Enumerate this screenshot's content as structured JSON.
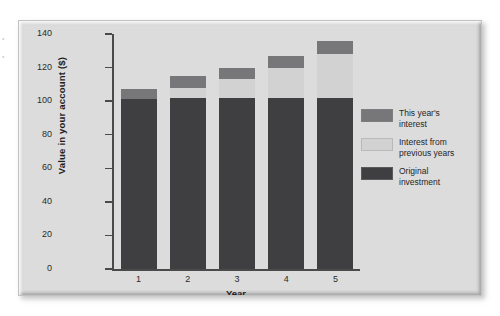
{
  "margin_bleed": [
    "•",
    "•"
  ],
  "chart_data": {
    "type": "bar",
    "subtype": "stacked-vertical",
    "title": "",
    "xlabel": "Year",
    "ylabel": "Value in your account ($)",
    "categories": [
      "1",
      "2",
      "3",
      "4",
      "5"
    ],
    "ylim": [
      0,
      140
    ],
    "yticks": [
      0,
      20,
      40,
      60,
      80,
      100,
      120,
      140
    ],
    "grid": false,
    "legend_position": "right",
    "series": [
      {
        "name": "Original investment",
        "color": "#3f3f42",
        "values": [
          101,
          102,
          102,
          102,
          102
        ]
      },
      {
        "name": "Interest from previous years",
        "color": "#d2d2d2",
        "values": [
          0,
          6,
          11,
          18,
          26
        ]
      },
      {
        "name": "This year's interest",
        "color": "#77777a",
        "values": [
          6,
          7,
          7,
          7,
          8
        ]
      }
    ],
    "totals": [
      107,
      115,
      120,
      127,
      136
    ],
    "annotations": []
  },
  "legend": {
    "items": [
      {
        "label_line1": "This year's",
        "label_line2": "interest",
        "color": "#77777a"
      },
      {
        "label_line1": "Interest from",
        "label_line2": "previous years",
        "color": "#d2d2d2"
      },
      {
        "label_line1": "Original",
        "label_line2": "investment",
        "color": "#3f3f42"
      }
    ]
  }
}
